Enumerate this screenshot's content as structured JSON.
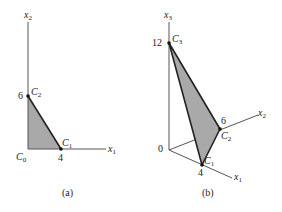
{
  "panel_a": {
    "caption": "(a)",
    "axis_x_label": "x",
    "axis_x_sub": "1",
    "axis_y_label": "x",
    "axis_y_sub": "2",
    "origin_label": "C",
    "origin_sub": "0",
    "tick_x": "4",
    "tick_y": "6",
    "points": [
      {
        "name": "C",
        "sub": "1",
        "coord": [
          4,
          0
        ]
      },
      {
        "name": "C",
        "sub": "2",
        "coord": [
          0,
          6
        ]
      }
    ],
    "fill_color": "#a9a9a9"
  },
  "panel_b": {
    "caption": "(b)",
    "axis_x1_label": "x",
    "axis_x1_sub": "1",
    "axis_x2_label": "x",
    "axis_x2_sub": "2",
    "axis_x3_label": "x",
    "axis_x3_sub": "3",
    "origin_label": "0",
    "tick_x1": "4",
    "tick_x2": "6",
    "tick_x3": "12",
    "points": [
      {
        "name": "C",
        "sub": "1",
        "coord": [
          4,
          0,
          0
        ]
      },
      {
        "name": "C",
        "sub": "2",
        "coord": [
          0,
          6,
          0
        ]
      },
      {
        "name": "C",
        "sub": "3",
        "coord": [
          0,
          0,
          12
        ]
      }
    ],
    "fill_color": "#a9a9a9"
  }
}
